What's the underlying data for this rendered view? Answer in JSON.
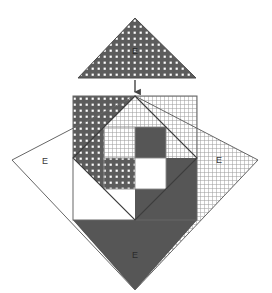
{
  "figure": {
    "canvas": {
      "width": 272,
      "height": 293,
      "background": "#ffffff"
    },
    "labels": {
      "top_triangle": "E",
      "left_region": "E",
      "right_region": "E",
      "bottom_region": "E"
    },
    "colors": {
      "dark_fill": "#565656",
      "dot_pattern_base": "#5c5c5c",
      "dot_pattern_dot": "#ffffff",
      "grid_pattern_base": "#ffffff",
      "grid_pattern_line": "#9a9a9a",
      "white_fill": "#ffffff",
      "stroke": "#666666",
      "stroke_dark": "#3d3d3d",
      "label_text": "#3a3a3a",
      "arrow": "#444444"
    },
    "geometry": {
      "top_triangle": {
        "apex": [
          135,
          18
        ],
        "base_left": [
          78,
          78
        ],
        "base_right": [
          196,
          78
        ],
        "fill": "dotted"
      },
      "arrow": {
        "from": [
          135,
          80
        ],
        "to": [
          135,
          95
        ]
      },
      "diamond": {
        "top": [
          135,
          96
        ],
        "right": [
          258,
          160
        ],
        "bottom": [
          135,
          290
        ],
        "left": [
          12,
          160
        ]
      },
      "square": {
        "left": 73,
        "top": 96,
        "right": 197,
        "bottom": 220
      },
      "inner_rotated_square": {
        "top": [
          135,
          96
        ],
        "right": [
          197,
          158
        ],
        "bottom": [
          135,
          220
        ],
        "left": [
          73,
          158
        ]
      },
      "center_grid": {
        "left": 104,
        "top": 127,
        "right": 166,
        "bottom": 189,
        "mid_x": 135,
        "mid_y": 158
      }
    },
    "regions": [
      {
        "name": "top-triangle",
        "fill": "dotted",
        "label": "E"
      },
      {
        "name": "left-diamond-wedge",
        "fill": "white",
        "label": "E"
      },
      {
        "name": "right-diamond-wedge",
        "fill": "grid",
        "label": "E"
      },
      {
        "name": "bottom-diamond-wedge",
        "fill": "dark",
        "label": "E"
      },
      {
        "name": "upper-left-square-wedge",
        "fill": "dotted",
        "label": ""
      },
      {
        "name": "upper-right-inner-wedge",
        "fill": "grid",
        "label": ""
      },
      {
        "name": "lower-right-inner-wedge",
        "fill": "dark",
        "label": ""
      },
      {
        "name": "lower-left-inner-wedge",
        "fill": "white",
        "label": ""
      },
      {
        "name": "center-quadrant-top-left",
        "fill": "grid",
        "label": ""
      },
      {
        "name": "center-quadrant-top-right",
        "fill": "dark",
        "label": ""
      },
      {
        "name": "center-quadrant-bottom-left",
        "fill": "dotted",
        "label": ""
      },
      {
        "name": "center-quadrant-bottom-right",
        "fill": "white",
        "label": ""
      }
    ]
  }
}
